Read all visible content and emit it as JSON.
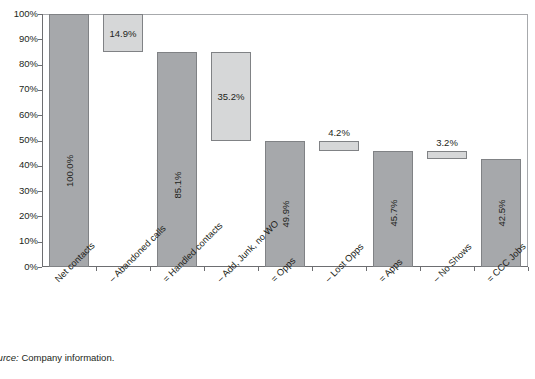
{
  "chart_data": {
    "type": "bar",
    "subtype": "waterfall",
    "title": "",
    "xlabel": "",
    "ylabel": "",
    "ylim": [
      0,
      100
    ],
    "ytick_labels": [
      "100%",
      "90%",
      "80%",
      "70%",
      "60%",
      "50%",
      "40%",
      "30%",
      "20%",
      "10%",
      "0%"
    ],
    "ytick_values": [
      100,
      90,
      80,
      70,
      60,
      50,
      40,
      30,
      20,
      10,
      0
    ],
    "grid": false,
    "legend": "none",
    "categories": [
      "Net contacts",
      "– Abandoned calls",
      "= Handled contacts",
      "– Add, Junk, no WO",
      "= Opps",
      "– Lost Opps",
      "= Apps",
      "– No Shows",
      "= CCC Jobs"
    ],
    "values": [
      100.0,
      14.9,
      85.1,
      35.2,
      49.9,
      4.2,
      45.7,
      3.2,
      42.5
    ],
    "value_labels": [
      "100.0%",
      "14.9%",
      "85.1%",
      "35.2%",
      "49.9%",
      "4.2%",
      "45.7%",
      "3.2%",
      "42.5%"
    ],
    "bars": [
      {
        "category": "Net contacts",
        "label": "100.0%",
        "kind": "total",
        "base": 0.0,
        "top": 100.0,
        "label_pos": "inside-vertical"
      },
      {
        "category": "– Abandoned calls",
        "label": "14.9%",
        "kind": "delta",
        "base": 85.1,
        "top": 100.0,
        "label_pos": "inside-horizontal"
      },
      {
        "category": "= Handled contacts",
        "label": "85.1%",
        "kind": "total",
        "base": 0.0,
        "top": 85.1,
        "label_pos": "inside-vertical"
      },
      {
        "category": "– Add, Junk, no WO",
        "label": "35.2%",
        "kind": "delta",
        "base": 49.9,
        "top": 85.1,
        "label_pos": "inside-horizontal"
      },
      {
        "category": "= Opps",
        "label": "49.9%",
        "kind": "total",
        "base": 0.0,
        "top": 49.9,
        "label_pos": "inside-vertical"
      },
      {
        "category": "– Lost Opps",
        "label": "4.2%",
        "kind": "delta",
        "base": 45.7,
        "top": 49.9,
        "label_pos": "above"
      },
      {
        "category": "= Apps",
        "label": "45.7%",
        "kind": "total",
        "base": 0.0,
        "top": 45.7,
        "label_pos": "inside-vertical"
      },
      {
        "category": "– No Shows",
        "label": "3.2%",
        "kind": "delta",
        "base": 42.5,
        "top": 45.7,
        "label_pos": "above"
      },
      {
        "category": "= CCC Jobs",
        "label": "42.5%",
        "kind": "total",
        "base": 0.0,
        "top": 42.5,
        "label_pos": "inside-vertical"
      }
    ],
    "colors": {
      "total_bar_fill": "#a6a8ab",
      "delta_bar_fill": "#d6d7d8",
      "bar_border": "#808285",
      "axis": "#6d6e71",
      "plot_border": "#a7a9ac",
      "text": "#231f20",
      "background": "#ffffff"
    }
  },
  "source_note": {
    "prefix": "Source:",
    "rest": " Company information."
  }
}
